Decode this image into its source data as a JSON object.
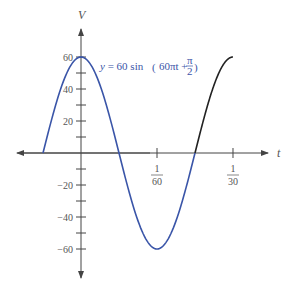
{
  "chart_data": {
    "type": "line",
    "title": "",
    "xlabel": "t",
    "ylabel": "V",
    "equation": {
      "lhs": "y",
      "eq": " = 60 sin ",
      "arg_main": "60πt + ",
      "frac_num": "π",
      "frac_den": "2",
      "open_paren": "(",
      "close_paren": ")"
    },
    "function": "y = 60 sin(60πt + π/2)",
    "amplitude": 60,
    "angular_frequency": "60π",
    "phase": "π/2",
    "x_range": [
      -0.008333,
      0.033333
    ],
    "ylim": [
      -60,
      60
    ],
    "grid": false,
    "x_ticks": [
      {
        "value": 0.016667,
        "num": "1",
        "den": "60"
      },
      {
        "value": 0.033333,
        "num": "1",
        "den": "30"
      }
    ],
    "y_ticks": [
      {
        "value": 60,
        "label": "60"
      },
      {
        "value": 50,
        "label": ""
      },
      {
        "value": 40,
        "label": "40"
      },
      {
        "value": 30,
        "label": ""
      },
      {
        "value": 20,
        "label": "20"
      },
      {
        "value": 10,
        "label": ""
      },
      {
        "value": -10,
        "label": ""
      },
      {
        "value": -20,
        "label": "−20"
      },
      {
        "value": -30,
        "label": ""
      },
      {
        "value": -40,
        "label": "−40"
      },
      {
        "value": -50,
        "label": ""
      },
      {
        "value": -60,
        "label": "−60"
      }
    ],
    "series": [
      {
        "name": "one period (blue)",
        "color": "#3a55a8",
        "t_start": -0.008333,
        "t_end": 0.025
      },
      {
        "name": "continuation (black)",
        "color": "#222222",
        "t_start": 0.025,
        "t_end": 0.033333
      }
    ],
    "key_points": [
      {
        "t": -0.008333,
        "y": 0
      },
      {
        "t": 0,
        "y": 60
      },
      {
        "t": 0.008333,
        "y": 0
      },
      {
        "t": 0.016667,
        "y": -60
      },
      {
        "t": 0.025,
        "y": 0
      },
      {
        "t": 0.033333,
        "y": 60
      }
    ]
  },
  "colors": {
    "curve_blue": "#3a55a8",
    "curve_black": "#222222",
    "axis": "#444444"
  }
}
